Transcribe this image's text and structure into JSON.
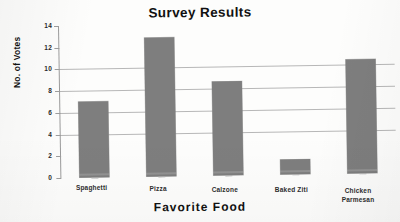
{
  "chart_data": {
    "type": "bar",
    "title": "Survey Results",
    "xlabel": "Favorite Food",
    "ylabel": "No. of Votes",
    "categories": [
      "Spaghetti",
      "Pizza",
      "Calzone",
      "Baked Ziti",
      "Chicken Parmesan"
    ],
    "values": [
      7,
      12.8,
      8.7,
      1.4,
      10.5
    ],
    "ylim": [
      0,
      14
    ],
    "yticks": [
      0,
      2,
      4,
      6,
      8,
      10,
      12,
      14
    ],
    "ytick_labels": [
      "0",
      "2",
      "4",
      "6",
      "8",
      "10",
      "12",
      "14"
    ],
    "gridlines_at": [
      4,
      6,
      8,
      10
    ],
    "grid": true,
    "legend": "none",
    "bar_color": "#7e7e7e",
    "background_color": "#fdfdfc",
    "text_color": "#111111"
  },
  "category_display": [
    {
      "line1": "Spaghetti",
      "line2": ""
    },
    {
      "line1": "Pizza",
      "line2": ""
    },
    {
      "line1": "Calzone",
      "line2": ""
    },
    {
      "line1": "Baked Ziti",
      "line2": ""
    },
    {
      "line1": "Chicken",
      "line2": "Parmesan"
    }
  ]
}
